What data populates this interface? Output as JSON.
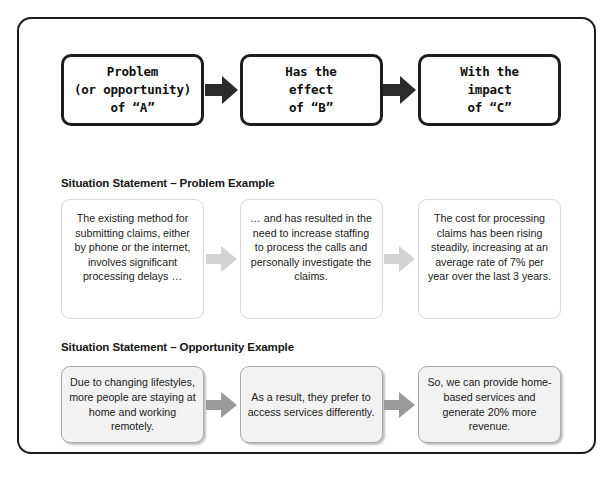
{
  "diagram": {
    "type": "situation-statement-flow",
    "template_row": {
      "boxes": [
        {
          "text": "Problem\n(or opportunity)\nof “A”"
        },
        {
          "text": "Has the\neffect\nof “B”"
        },
        {
          "text": "With the\nimpact\nof “C”"
        }
      ],
      "arrow_color": "#2b2b2b"
    },
    "problem_section": {
      "heading": "Situation Statement – Problem Example",
      "boxes": [
        {
          "text": "The existing method for submitting claims, either by phone or the internet, involves significant processing delays …"
        },
        {
          "text": "… and has resulted in the need to increase staffing to process the calls and personally investigate the claims."
        },
        {
          "text": "The cost for processing claims has been rising steadily, increasing at an average rate of 7% per year over the last 3 years."
        }
      ],
      "arrow_color": "#d2d2d2"
    },
    "opportunity_section": {
      "heading": "Situation Statement – Opportunity Example",
      "boxes": [
        {
          "text": "Due to changing lifestyles, more people are staying at home and working remotely."
        },
        {
          "text": "As a result, they prefer to access services differently."
        },
        {
          "text": "So, we can provide home-based services and generate 20% more revenue."
        }
      ],
      "arrow_color": "#9a9a9a"
    },
    "frame_color": "#1d1d1d",
    "background_color": "#ffffff"
  }
}
